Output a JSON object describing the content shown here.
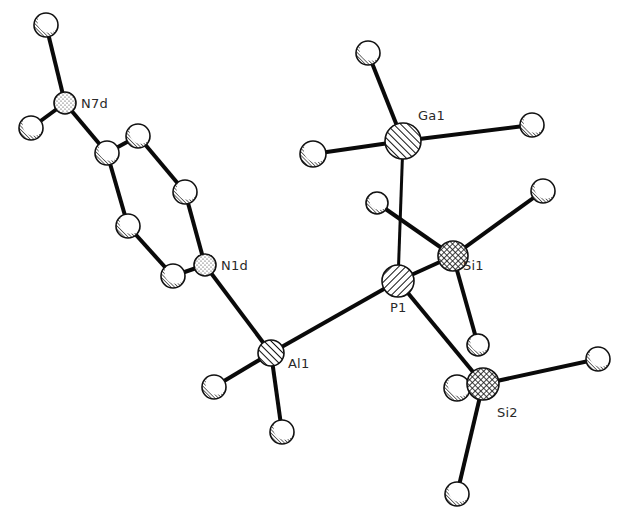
{
  "figure": {
    "type": "ORTEP-style molecular structure plot",
    "width": 624,
    "height": 520
  },
  "labels": {
    "N7d": "N7d",
    "N1d": "N1d",
    "Ga1": "Ga1",
    "Si1": "Si1",
    "P1": "P1",
    "Al1": "Al1",
    "Si2": "Si2"
  },
  "atoms": [
    {
      "id": "H_N7a",
      "element": "H",
      "x": 46,
      "y": 25,
      "r": 12,
      "style": "plain"
    },
    {
      "id": "N7d",
      "element": "N",
      "x": 65,
      "y": 103,
      "r": 11,
      "style": "stipple",
      "label": "N7d"
    },
    {
      "id": "H_N7b",
      "element": "H",
      "x": 31,
      "y": 128,
      "r": 12,
      "style": "plain"
    },
    {
      "id": "C4d",
      "element": "C",
      "x": 107,
      "y": 153,
      "r": 12,
      "style": "plain"
    },
    {
      "id": "C3d",
      "element": "C",
      "x": 138,
      "y": 136,
      "r": 12,
      "style": "plain"
    },
    {
      "id": "C2d",
      "element": "C",
      "x": 185,
      "y": 192,
      "r": 12,
      "style": "plain"
    },
    {
      "id": "N1d",
      "element": "N",
      "x": 205,
      "y": 265,
      "r": 11,
      "style": "stipple",
      "label": "N1d"
    },
    {
      "id": "C6d",
      "element": "C",
      "x": 173,
      "y": 276,
      "r": 12,
      "style": "plain"
    },
    {
      "id": "C5d",
      "element": "C",
      "x": 128,
      "y": 226,
      "r": 12,
      "style": "plain"
    },
    {
      "id": "Al1",
      "element": "Al",
      "x": 271,
      "y": 353,
      "r": 13,
      "style": "hatch-fwd",
      "label": "Al1"
    },
    {
      "id": "H_Al1a",
      "element": "H",
      "x": 214,
      "y": 387,
      "r": 12,
      "style": "plain"
    },
    {
      "id": "H_Al1b",
      "element": "H",
      "x": 282,
      "y": 432,
      "r": 12,
      "style": "plain"
    },
    {
      "id": "P1",
      "element": "P",
      "x": 398,
      "y": 281,
      "r": 16,
      "style": "hatch-back",
      "label": "P1"
    },
    {
      "id": "Ga1",
      "element": "Ga",
      "x": 403,
      "y": 141,
      "r": 18,
      "style": "hatch-fwd",
      "label": "Ga1"
    },
    {
      "id": "H_Ga1a",
      "element": "H",
      "x": 368,
      "y": 53,
      "r": 12,
      "style": "plain"
    },
    {
      "id": "H_Ga1b",
      "element": "H",
      "x": 313,
      "y": 154,
      "r": 13,
      "style": "plain"
    },
    {
      "id": "H_Ga1c",
      "element": "H",
      "x": 532,
      "y": 125,
      "r": 12,
      "style": "plain"
    },
    {
      "id": "Si1",
      "element": "Si",
      "x": 453,
      "y": 256,
      "r": 15,
      "style": "crosshatch",
      "label": "Si1"
    },
    {
      "id": "H_Si1a",
      "element": "H",
      "x": 377,
      "y": 203,
      "r": 11,
      "style": "plain"
    },
    {
      "id": "H_Si1b",
      "element": "H",
      "x": 543,
      "y": 191,
      "r": 12,
      "style": "plain"
    },
    {
      "id": "H_Si1c",
      "element": "H",
      "x": 478,
      "y": 345,
      "r": 11,
      "style": "plain"
    },
    {
      "id": "H_Si2a",
      "element": "H",
      "x": 457,
      "y": 388,
      "r": 13,
      "style": "plain"
    },
    {
      "id": "Si2",
      "element": "Si",
      "x": 483,
      "y": 384,
      "r": 16,
      "style": "crosshatch",
      "label": "Si2"
    },
    {
      "id": "H_Si2b",
      "element": "H",
      "x": 598,
      "y": 359,
      "r": 12,
      "style": "plain"
    },
    {
      "id": "H_Si2c",
      "element": "H",
      "x": 457,
      "y": 494,
      "r": 12,
      "style": "plain"
    }
  ],
  "bonds": [
    [
      "H_N7a",
      "N7d"
    ],
    [
      "H_N7b",
      "N7d"
    ],
    [
      "N7d",
      "C4d"
    ],
    [
      "C4d",
      "C3d"
    ],
    [
      "C3d",
      "C2d"
    ],
    [
      "C2d",
      "N1d"
    ],
    [
      "N1d",
      "C6d"
    ],
    [
      "C6d",
      "C5d"
    ],
    [
      "C5d",
      "C4d"
    ],
    [
      "N1d",
      "Al1"
    ],
    [
      "Al1",
      "H_Al1a"
    ],
    [
      "Al1",
      "H_Al1b"
    ],
    [
      "Al1",
      "P1"
    ],
    [
      "P1",
      "Ga1",
      "thin"
    ],
    [
      "Ga1",
      "H_Ga1a"
    ],
    [
      "Ga1",
      "H_Ga1b"
    ],
    [
      "Ga1",
      "H_Ga1c"
    ],
    [
      "P1",
      "Si1"
    ],
    [
      "Si1",
      "H_Si1a"
    ],
    [
      "Si1",
      "H_Si1b"
    ],
    [
      "Si1",
      "H_Si1c"
    ],
    [
      "P1",
      "Si2"
    ],
    [
      "Si2",
      "H_Si2a"
    ],
    [
      "Si2",
      "H_Si2b"
    ],
    [
      "Si2",
      "H_Si2c"
    ]
  ],
  "label_positions": {
    "N7d": {
      "x": 81,
      "y": 108
    },
    "N1d": {
      "x": 221,
      "y": 270
    },
    "Ga1": {
      "x": 418,
      "y": 120
    },
    "Si1": {
      "x": 463,
      "y": 270
    },
    "P1": {
      "x": 390,
      "y": 312
    },
    "Al1": {
      "x": 288,
      "y": 368
    },
    "Si2": {
      "x": 497,
      "y": 417
    }
  },
  "colors": {
    "bond": "#0a0a0a",
    "outline": "#111111",
    "label": "#2a2a2a",
    "background": "#ffffff"
  }
}
